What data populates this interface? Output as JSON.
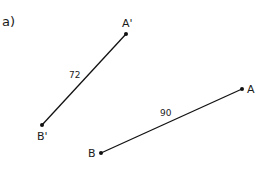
{
  "part_label": "a)",
  "segments": [
    {
      "name": "A'B'",
      "from": "A'",
      "to": "B'",
      "length_label": "72",
      "from_xy": [
        126,
        34
      ],
      "to_xy": [
        42,
        125
      ]
    },
    {
      "name": "AB",
      "from": "A",
      "to": "B",
      "length_label": "90",
      "from_xy": [
        242,
        89
      ],
      "to_xy": [
        101,
        153
      ]
    }
  ],
  "points": {
    "A_prime": "A'",
    "B_prime": "B'",
    "A": "A",
    "B": "B"
  },
  "lengths": {
    "a_prime_b_prime": "72",
    "ab": "90"
  },
  "colors": {
    "line": "#111111",
    "background": "#ffffff"
  }
}
